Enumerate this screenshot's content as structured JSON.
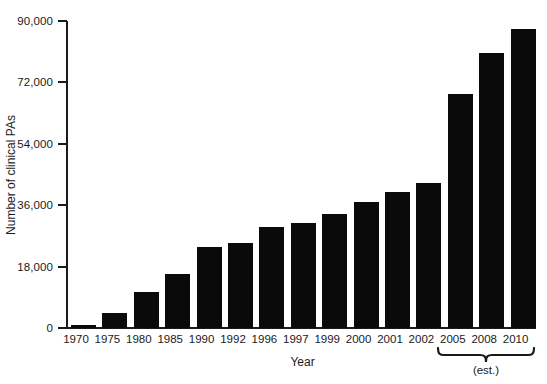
{
  "chart_data": {
    "type": "bar",
    "title": "",
    "xlabel": "Year",
    "ylabel": "Number of clinical PAs",
    "categories": [
      "1970",
      "1975",
      "1980",
      "1985",
      "1990",
      "1992",
      "1996",
      "1997",
      "1999",
      "2000",
      "2001",
      "2002",
      "2005",
      "2008",
      "2010"
    ],
    "values": [
      1000,
      4400,
      10500,
      15800,
      23700,
      24900,
      29600,
      30800,
      33400,
      36900,
      39900,
      42500,
      68600,
      80600,
      87700
    ],
    "ylim": [
      0,
      90000
    ],
    "yticks": [
      0,
      18000,
      36000,
      54000,
      72000,
      90000
    ],
    "ytick_labels": [
      "0",
      "18,000",
      "36,000",
      "54,000",
      "72,000",
      "90,000"
    ],
    "grid": false,
    "legend": null,
    "bar_color": "#0a0a0a",
    "annotations": [
      {
        "text": "(est.)",
        "type": "brace",
        "covers": [
          "2005",
          "2008",
          "2010"
        ]
      }
    ]
  },
  "annotation": {
    "est_label": "(est.)"
  }
}
